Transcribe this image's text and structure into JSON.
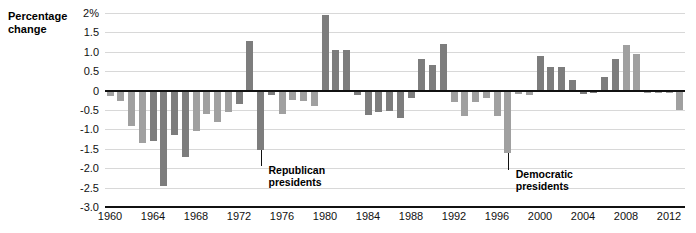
{
  "chart_data": {
    "type": "bar",
    "title": "",
    "subtitle": "",
    "xlabel": "",
    "ylabel": "Percentage change",
    "ylim": [
      -3.0,
      2.0
    ],
    "ytick_labels": [
      "2%",
      "1.5",
      "1.0",
      "0.5",
      "0",
      "-0.5",
      "-1.0",
      "-1.5",
      "-2.0",
      "-2.5",
      "-3.0"
    ],
    "ytick_values": [
      2.0,
      1.5,
      1.0,
      0.5,
      0,
      -0.5,
      -1.0,
      -1.5,
      -2.0,
      -2.5,
      -3.0
    ],
    "xtick_labels": [
      "1960",
      "1964",
      "1968",
      "1972",
      "1976",
      "1980",
      "1984",
      "1988",
      "1992",
      "1996",
      "2000",
      "2004",
      "2008",
      "2012"
    ],
    "xtick_values": [
      1960,
      1964,
      1968,
      1972,
      1976,
      1980,
      1984,
      1988,
      1992,
      1996,
      2000,
      2004,
      2008,
      2012
    ],
    "grid": true,
    "legend_position": "none",
    "colors": {
      "democratic": "#a0a0a0",
      "republican": "#7d7d7d",
      "axis": "#111111",
      "gridline": "#d8d8d8"
    },
    "categories": [
      1960,
      1961,
      1962,
      1963,
      1964,
      1965,
      1966,
      1967,
      1968,
      1969,
      1970,
      1971,
      1972,
      1973,
      1974,
      1975,
      1976,
      1977,
      1978,
      1979,
      1980,
      1981,
      1982,
      1983,
      1984,
      1985,
      1986,
      1987,
      1988,
      1989,
      1990,
      1991,
      1992,
      1993,
      1994,
      1995,
      1996,
      1997,
      1998,
      1999,
      2000,
      2001,
      2002,
      2003,
      2004,
      2005,
      2006,
      2007,
      2008,
      2009,
      2010,
      2011,
      2012,
      2013
    ],
    "values": [
      -0.15,
      -0.27,
      -0.9,
      -1.35,
      -1.3,
      -2.45,
      -1.15,
      -1.7,
      -1.05,
      -0.6,
      -0.8,
      -0.55,
      -0.35,
      1.28,
      -1.52,
      -0.12,
      -0.6,
      -0.25,
      -0.28,
      -0.4,
      1.95,
      1.05,
      1.05,
      -0.12,
      -0.62,
      -0.55,
      -0.52,
      -0.7,
      -0.2,
      0.82,
      0.65,
      1.2,
      -0.3,
      -0.65,
      -0.3,
      -0.18,
      -0.65,
      -1.6,
      -0.08,
      -0.12,
      0.9,
      0.6,
      0.6,
      0.28,
      -0.1,
      -0.07,
      0.35,
      0.82,
      1.18,
      0.95,
      -0.05,
      -0.05,
      -0.05,
      -0.5
    ],
    "party": [
      "democratic",
      "democratic",
      "democratic",
      "democratic",
      "republican",
      "republican",
      "republican",
      "republican",
      "democratic",
      "democratic",
      "democratic",
      "democratic",
      "republican",
      "republican",
      "republican",
      "republican",
      "democratic",
      "democratic",
      "democratic",
      "democratic",
      "republican",
      "republican",
      "republican",
      "republican",
      "republican",
      "republican",
      "republican",
      "republican",
      "republican",
      "republican",
      "republican",
      "republican",
      "democratic",
      "democratic",
      "democratic",
      "democratic",
      "democratic",
      "democratic",
      "democratic",
      "democratic",
      "republican",
      "republican",
      "republican",
      "republican",
      "republican",
      "republican",
      "republican",
      "republican",
      "democratic",
      "democratic",
      "democratic",
      "democratic",
      "democratic",
      "democratic"
    ],
    "annotations": [
      {
        "text_line1": "Republican",
        "text_line2": "presidents",
        "pointer_year": 1974
      },
      {
        "text_line1": "Democratic",
        "text_line2": "presidents",
        "pointer_year": 1997
      }
    ]
  },
  "annotation_republican": {
    "line1": "Republican",
    "line2": "presidents"
  },
  "annotation_democratic": {
    "line1": "Democratic",
    "line2": "presidents"
  },
  "axis": {
    "y_title_line1": "Percentage",
    "y_title_line2": "change"
  }
}
